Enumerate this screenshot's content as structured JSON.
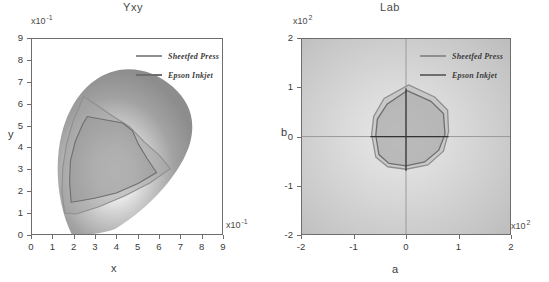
{
  "figure": {
    "background": "#ffffff",
    "panels": [
      "Yxy",
      "Lab"
    ]
  },
  "legend": {
    "entries": [
      {
        "label": "Sheetfed Press",
        "color": "#8f8f8f"
      },
      {
        "label": "Epson Inkjet",
        "color": "#6e6e6e"
      }
    ]
  },
  "chart_data": [
    {
      "type": "line",
      "title": "Yxy",
      "xlabel": "x",
      "ylabel": "y",
      "x_multiplier": "x10",
      "x_exponent": "-1",
      "y_multiplier": "x10",
      "y_exponent": "-1",
      "xlim": [
        0,
        9
      ],
      "ylim": [
        0,
        9
      ],
      "xticks": [
        0,
        1,
        2,
        3,
        4,
        5,
        6,
        7,
        8,
        9
      ],
      "yticks": [
        0,
        1,
        2,
        3,
        4,
        5,
        6,
        7,
        8,
        9
      ],
      "xticklabels": [
        "0",
        "1",
        "2",
        "3",
        "4",
        "5",
        "6",
        "7",
        "8",
        "9"
      ],
      "yticklabels": [
        "0",
        "1",
        "2",
        "3",
        "4",
        "5",
        "6",
        "7",
        "8",
        "9"
      ],
      "grid": false,
      "legend_position": "top-right",
      "annotation": "CIE chromaticity horseshoe (grayscale) with two device gamut outlines",
      "series": [
        {
          "name": "Sheetfed Press",
          "color": "#8f8f8f",
          "points": [
            [
              1.55,
              1.05
            ],
            [
              1.42,
              2.0
            ],
            [
              1.45,
              3.1
            ],
            [
              1.62,
              4.2
            ],
            [
              1.95,
              5.3
            ],
            [
              2.45,
              6.42
            ],
            [
              3.05,
              6.05
            ],
            [
              3.8,
              5.55
            ],
            [
              4.62,
              5.05
            ],
            [
              5.3,
              4.35
            ],
            [
              6.05,
              3.7
            ],
            [
              6.55,
              3.1
            ],
            [
              5.6,
              2.45
            ],
            [
              4.4,
              1.85
            ],
            [
              3.2,
              1.35
            ],
            [
              2.1,
              1.0
            ]
          ]
        },
        {
          "name": "Epson Inkjet",
          "color": "#6e6e6e",
          "points": [
            [
              1.85,
              1.6
            ],
            [
              1.78,
              2.55
            ],
            [
              1.82,
              3.5
            ],
            [
              2.05,
              4.4
            ],
            [
              2.4,
              5.2
            ],
            [
              2.62,
              5.55
            ],
            [
              3.45,
              5.4
            ],
            [
              4.3,
              5.25
            ],
            [
              4.75,
              4.9
            ],
            [
              5.05,
              4.25
            ],
            [
              5.45,
              3.6
            ],
            [
              5.9,
              2.95
            ],
            [
              5.05,
              2.4
            ],
            [
              4.0,
              1.95
            ],
            [
              2.95,
              1.7
            ],
            [
              2.3,
              1.58
            ]
          ]
        }
      ]
    },
    {
      "type": "line",
      "title": "Lab",
      "xlabel": "a",
      "ylabel": "b",
      "x_multiplier": "x10",
      "x_exponent": "2",
      "y_multiplier": "x10",
      "y_exponent": "2",
      "xlim": [
        -2,
        2
      ],
      "ylim": [
        -2,
        2
      ],
      "xticks": [
        -2,
        -1,
        0,
        1,
        2
      ],
      "yticks": [
        -2,
        -1,
        0,
        1,
        2
      ],
      "xticklabels": [
        "-2",
        "-1",
        "0",
        "1",
        "2"
      ],
      "yticklabels": [
        "-2",
        "-1",
        "0",
        "1",
        "2"
      ],
      "grid": false,
      "legend_position": "top-right",
      "annotation": "Lab gamut cross-section with zero axes crossing at origin",
      "series": [
        {
          "name": "Sheetfed Press",
          "color": "#8f8f8f",
          "points": [
            [
              0.05,
              1.07
            ],
            [
              0.55,
              0.82
            ],
            [
              0.8,
              0.55
            ],
            [
              0.82,
              0.1
            ],
            [
              0.72,
              -0.3
            ],
            [
              0.42,
              -0.58
            ],
            [
              0.0,
              -0.67
            ],
            [
              -0.35,
              -0.62
            ],
            [
              -0.58,
              -0.42
            ],
            [
              -0.66,
              0.05
            ],
            [
              -0.62,
              0.42
            ],
            [
              -0.42,
              0.78
            ]
          ]
        },
        {
          "name": "Epson Inkjet",
          "color": "#6e6e6e",
          "points": [
            [
              0.02,
              0.95
            ],
            [
              0.48,
              0.72
            ],
            [
              0.72,
              0.48
            ],
            [
              0.75,
              0.05
            ],
            [
              0.63,
              -0.28
            ],
            [
              0.36,
              -0.52
            ],
            [
              0.0,
              -0.6
            ],
            [
              -0.33,
              -0.55
            ],
            [
              -0.52,
              -0.36
            ],
            [
              -0.58,
              0.02
            ],
            [
              -0.55,
              0.36
            ],
            [
              -0.36,
              0.68
            ]
          ]
        }
      ]
    }
  ]
}
